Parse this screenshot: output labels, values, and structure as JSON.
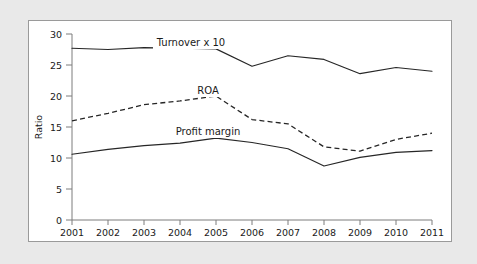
{
  "chart_data": {
    "type": "line",
    "title": "",
    "xlabel": "",
    "ylabel": "Ratio",
    "categories": [
      "2001",
      "2002",
      "2003",
      "2004",
      "2005",
      "2006",
      "2007",
      "2008",
      "2009",
      "2010",
      "2011"
    ],
    "x": [
      2001,
      2002,
      2003,
      2004,
      2005,
      2006,
      2007,
      2008,
      2009,
      2010,
      2011
    ],
    "xlim": [
      2001,
      2011
    ],
    "ylim": [
      0,
      30
    ],
    "yticks": [
      0,
      5,
      10,
      15,
      20,
      25,
      30
    ],
    "ytick_labels": [
      "0",
      "5",
      "10",
      "15",
      "20",
      "25",
      "30"
    ],
    "grid": false,
    "legend": "inline-labels",
    "series": [
      {
        "name": "Turnover x 10",
        "style": "solid",
        "color": "#262626",
        "values": [
          27.7,
          27.5,
          27.8,
          27.7,
          27.6,
          24.8,
          26.5,
          25.9,
          23.6,
          24.6,
          24.0
        ]
      },
      {
        "name": "ROA",
        "style": "dashed",
        "color": "#262626",
        "values": [
          16.0,
          17.2,
          18.6,
          19.2,
          20.0,
          16.2,
          15.5,
          11.8,
          11.1,
          13.0,
          14.0
        ]
      },
      {
        "name": "Profit margin",
        "style": "solid",
        "color": "#262626",
        "values": [
          10.6,
          11.4,
          12.0,
          12.4,
          13.2,
          12.5,
          11.5,
          8.7,
          10.1,
          10.9,
          11.2
        ]
      }
    ],
    "annotations": [
      {
        "text": "Turnover x 10",
        "x": 2004.6,
        "y": 28.9
      },
      {
        "text": "ROA",
        "x": 2004.5,
        "y": 21.2
      },
      {
        "text": "Profit margin",
        "x": 2004.1,
        "y": 14.6
      }
    ]
  },
  "figure": {
    "background_color": "#e9e9e9",
    "panel_color": "#ffffff",
    "border_color": "#9a9a9a",
    "axis_color": "#7c7c7c",
    "ink_color": "#262626"
  }
}
